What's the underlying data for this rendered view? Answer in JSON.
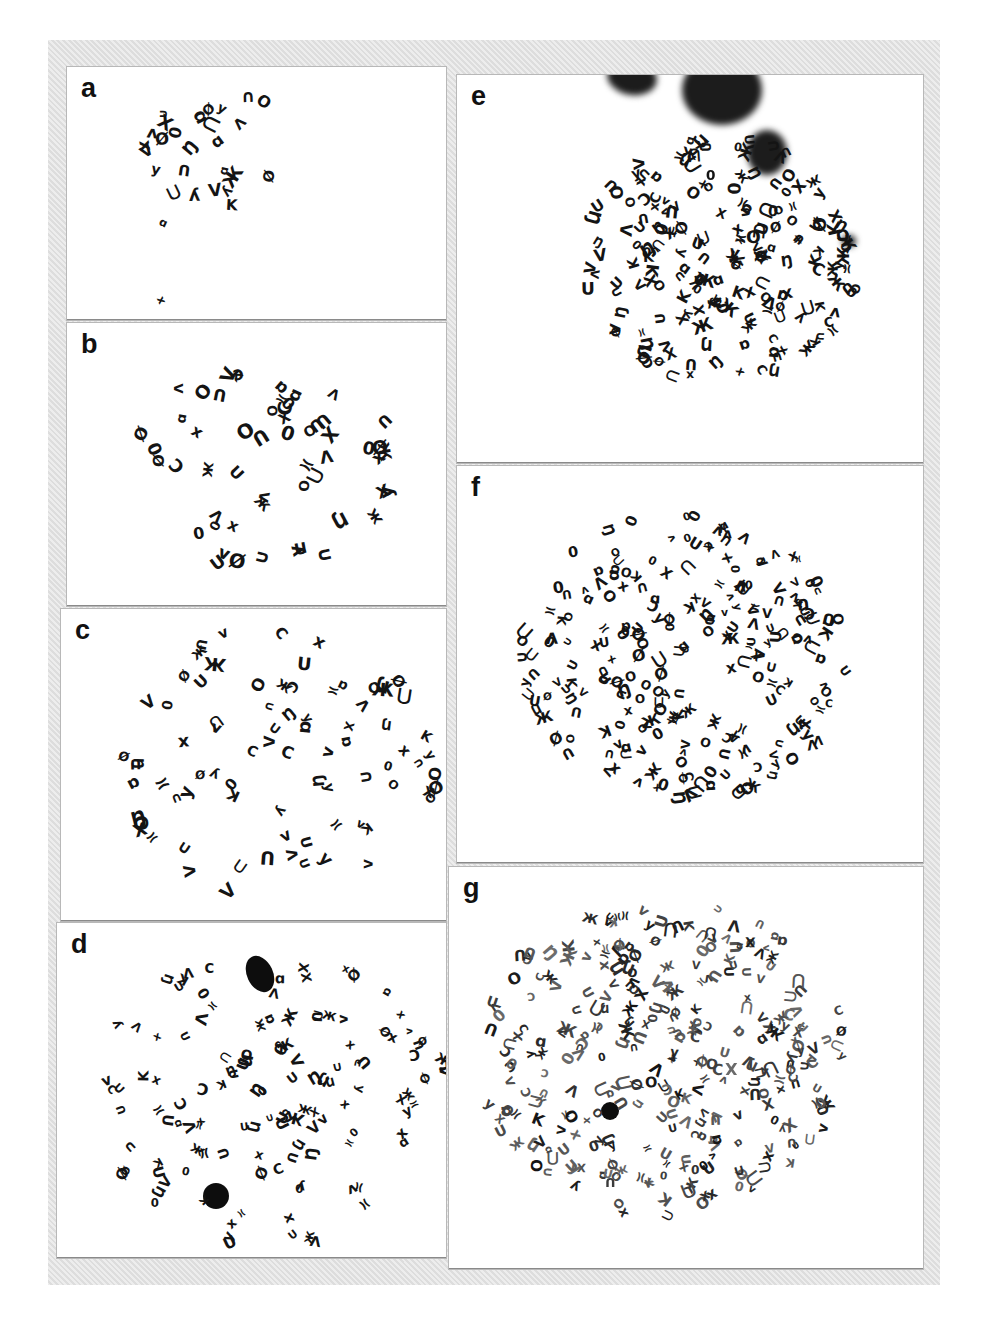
{
  "figure": {
    "background_color": "#e4e4e4",
    "chromosome_color": "#141414",
    "panels": [
      {
        "id": "a",
        "label": "a",
        "box": [
          66,
          66,
          379,
          253
        ],
        "clusters": [
          {
            "cx": 160,
            "cy": 80,
            "rx": 80,
            "ry": 65,
            "n": 26,
            "size": 15
          },
          {
            "cx": 100,
            "cy": 160,
            "rx": 4,
            "ry": 4,
            "n": 1,
            "size": 13
          },
          {
            "cx": 95,
            "cy": 230,
            "rx": 4,
            "ry": 4,
            "n": 1,
            "size": 12
          }
        ],
        "blobs": []
      },
      {
        "id": "b",
        "label": "b",
        "box": [
          66,
          322,
          379,
          283
        ],
        "clusters": [
          {
            "cx": 200,
            "cy": 140,
            "rx": 130,
            "ry": 110,
            "n": 55,
            "size": 16
          }
        ],
        "blobs": []
      },
      {
        "id": "c",
        "label": "c",
        "box": [
          60,
          608,
          385,
          312
        ],
        "clusters": [
          {
            "cx": 215,
            "cy": 155,
            "rx": 165,
            "ry": 140,
            "n": 80,
            "size": 15
          }
        ],
        "blobs": []
      },
      {
        "id": "d",
        "label": "d",
        "box": [
          56,
          922,
          389,
          335
        ],
        "clusters": [
          {
            "cx": 215,
            "cy": 175,
            "rx": 180,
            "ry": 150,
            "n": 125,
            "size": 13
          }
        ],
        "blobs": [
          {
            "x": 190,
            "y": 32,
            "w": 26,
            "h": 38,
            "rot": -25
          },
          {
            "x": 146,
            "y": 260,
            "w": 26,
            "h": 26,
            "rot": 0
          }
        ]
      },
      {
        "id": "e",
        "label": "e",
        "box": [
          456,
          74,
          466,
          388
        ],
        "clusters": [
          {
            "cx": 265,
            "cy": 185,
            "rx": 140,
            "ry": 125,
            "n": 190,
            "size": 14
          }
        ],
        "blobs": [
          {
            "x": 150,
            "y": -15,
            "w": 50,
            "h": 35,
            "rot": 10
          },
          {
            "x": 225,
            "y": -20,
            "w": 80,
            "h": 70,
            "rot": 0
          },
          {
            "x": 290,
            "y": 55,
            "w": 40,
            "h": 45,
            "rot": 0
          },
          {
            "x": 385,
            "y": 160,
            "w": 14,
            "h": 12,
            "rot": 0
          }
        ]
      },
      {
        "id": "f",
        "label": "f",
        "box": [
          456,
          465,
          466,
          397
        ],
        "clusters": [
          {
            "cx": 230,
            "cy": 190,
            "rx": 165,
            "ry": 145,
            "n": 230,
            "size": 13
          }
        ],
        "blobs": []
      },
      {
        "id": "g",
        "label": "g",
        "box": [
          448,
          866,
          474,
          402
        ],
        "clusters": [
          {
            "cx": 215,
            "cy": 190,
            "rx": 185,
            "ry": 160,
            "n": 300,
            "size": 13
          }
        ],
        "blobs": [
          {
            "x": 152,
            "y": 235,
            "w": 18,
            "h": 18,
            "rot": 0
          }
        ]
      }
    ],
    "glyphs": [
      "U",
      "X",
      "O",
      "V",
      "Λ",
      "∩",
      "C",
      "K",
      "x",
      "0",
      "Ŋ",
      "ʌ",
      "ɒ",
      "Ø",
      "Ж",
      "ʎ",
      "⋂",
      "ᑎ",
      "≍"
    ]
  }
}
